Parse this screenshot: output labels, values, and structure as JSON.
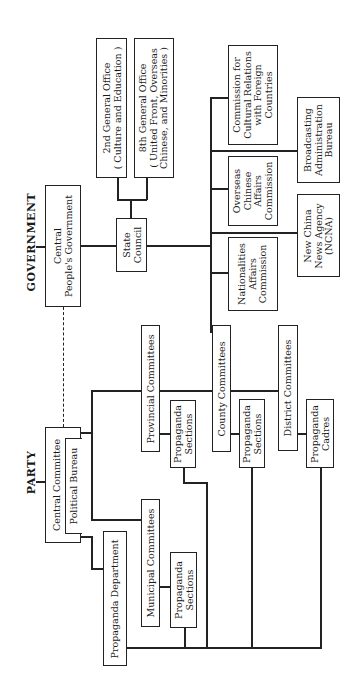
{
  "headers": {
    "government": "GOVERNMENT",
    "party": "PARTY"
  },
  "government": {
    "cpg": [
      "Central",
      "People's Government"
    ],
    "state_council": [
      "State",
      "Council"
    ],
    "office2": [
      "2nd General Office",
      "( Culture and Education )"
    ],
    "office8": [
      "8th General Office",
      "( United Front, Overseas",
      "Chinese, and Minorities )"
    ],
    "cultural": [
      "Commission for",
      "Cultural Relations",
      "with Foreign",
      "Countries"
    ],
    "broadcasting": [
      "Broadcasting",
      "Administration",
      "Bureau"
    ],
    "overseas": [
      "Overseas",
      "Chinese",
      "Affairs",
      "Commission"
    ],
    "ncna": [
      "New China",
      "News Agency",
      "(NCNA)"
    ],
    "nationalities": [
      "Nationalities",
      "Affairs",
      "Commission"
    ]
  },
  "party": {
    "central_committee": "Central Committee",
    "political_bureau": "Political Bureau",
    "propaganda_dept": "Propaganda Department",
    "provincial": "Provincial Committees",
    "provincial_sections": [
      "Propaganda",
      "Sections"
    ],
    "municipal": "Municipal Committees",
    "municipal_sections": [
      "Propaganda",
      "Sections"
    ],
    "county": "County Committees",
    "county_sections": [
      "Propaganda",
      "Sections"
    ],
    "district": "District Committees",
    "district_cadres": [
      "Propaganda",
      "Cadres"
    ]
  },
  "colors": {
    "line": "#222222",
    "background": "#ffffff"
  }
}
